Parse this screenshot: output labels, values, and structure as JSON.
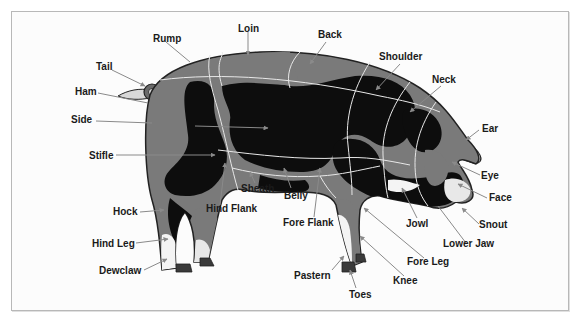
{
  "diagram": {
    "colors": {
      "body_gray": "#7a7a7a",
      "body_black": "#0d0d0d",
      "light_gray": "#d8d8d8",
      "white": "#f4f4f4",
      "outline": "#222222",
      "section_line": "#e8e8e8",
      "leader_line": "#8a8a8a",
      "label_text": "#1a1a1a",
      "frame_border": "#b8b8b8"
    },
    "labels": [
      {
        "id": "rump",
        "text": "Rump"
      },
      {
        "id": "loin",
        "text": "Loin"
      },
      {
        "id": "back",
        "text": "Back"
      },
      {
        "id": "shoulder",
        "text": "Shoulder"
      },
      {
        "id": "neck",
        "text": "Neck"
      },
      {
        "id": "tail",
        "text": "Tail"
      },
      {
        "id": "ham",
        "text": "Ham"
      },
      {
        "id": "side",
        "text": "Side"
      },
      {
        "id": "stifle",
        "text": "Stifle"
      },
      {
        "id": "ear",
        "text": "Ear"
      },
      {
        "id": "eye",
        "text": "Eye"
      },
      {
        "id": "face",
        "text": "Face"
      },
      {
        "id": "snout",
        "text": "Snout"
      },
      {
        "id": "sheath",
        "text": "Sheath"
      },
      {
        "id": "belly",
        "text": "Belly"
      },
      {
        "id": "hind_flank",
        "text": "Hind Flank"
      },
      {
        "id": "fore_flank",
        "text": "Fore Flank"
      },
      {
        "id": "hock",
        "text": "Hock"
      },
      {
        "id": "hind_leg",
        "text": "Hind Leg"
      },
      {
        "id": "dewclaw",
        "text": "Dewclaw"
      },
      {
        "id": "jowl",
        "text": "Jowl"
      },
      {
        "id": "lower_jaw",
        "text": "Lower Jaw"
      },
      {
        "id": "fore_leg",
        "text": "Fore Leg"
      },
      {
        "id": "knee",
        "text": "Knee"
      },
      {
        "id": "pastern",
        "text": "Pastern"
      },
      {
        "id": "toes",
        "text": "Toes"
      }
    ]
  }
}
